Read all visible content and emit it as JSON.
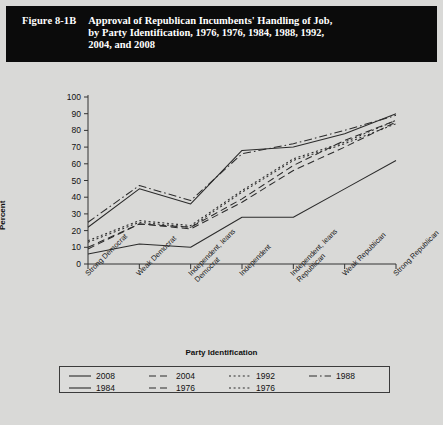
{
  "figure": {
    "number": "Figure 8-1B",
    "title_lines": [
      "Approval of Republican Incumbents' Handling of Job,",
      "by Party Identification, 1976, 1976, 1984, 1988, 1992,",
      "2004, and 2008"
    ]
  },
  "chart_data": {
    "type": "line",
    "title": "Approval of Republican Incumbents' Handling of Job, by Party Identification, 1976, 1976, 1984, 1988, 1992, 2004, and 2008",
    "xlabel": "Party Identification",
    "ylabel": "Percent",
    "ylim": [
      0,
      100
    ],
    "yticks": [
      0,
      10,
      20,
      30,
      40,
      50,
      60,
      70,
      80,
      90,
      100
    ],
    "grid": false,
    "legend_position": "bottom",
    "categories": [
      "Strong Democrat",
      "Weak Democrat",
      "Independent, leans Democrat",
      "Independent",
      "Independent, leans Republican",
      "Weak Republican",
      "Strong Republican"
    ],
    "category_lines": [
      [
        "Strong Democrat",
        ""
      ],
      [
        "Weak Democrat",
        ""
      ],
      [
        "Independent, leans",
        "Democrat"
      ],
      [
        "Independent",
        ""
      ],
      [
        "Independent, leans",
        "Republican"
      ],
      [
        "Weak Republican",
        ""
      ],
      [
        "Strong Republican",
        ""
      ]
    ],
    "series": [
      {
        "name": "2008",
        "dash": "solid",
        "values": [
          6,
          12,
          10,
          28,
          28,
          45,
          62
        ]
      },
      {
        "name": "2004",
        "dash": "dashed",
        "values": [
          9,
          24,
          22,
          39,
          59,
          74,
          86
        ]
      },
      {
        "name": "1992",
        "dash": "dotted",
        "values": [
          13,
          25,
          22,
          43,
          62,
          72,
          84
        ]
      },
      {
        "name": "1988",
        "dash": "dashdot",
        "values": [
          25,
          47,
          38,
          66,
          72,
          80,
          89
        ]
      },
      {
        "name": "1984",
        "dash": "solid",
        "values": [
          22,
          45,
          36,
          68,
          70,
          78,
          90
        ]
      },
      {
        "name": "1976",
        "dash": "dashed",
        "values": [
          10,
          24,
          21,
          37,
          56,
          70,
          85
        ]
      },
      {
        "name": "1976",
        "dash": "dotted",
        "values": [
          14,
          26,
          23,
          44,
          63,
          73,
          86
        ]
      }
    ]
  },
  "legend": {
    "rows": [
      [
        {
          "label": "2008",
          "dash": "solid"
        },
        {
          "label": "2004",
          "dash": "dashed"
        },
        {
          "label": "1992",
          "dash": "dotted"
        },
        {
          "label": "1988",
          "dash": "dashdot"
        }
      ],
      [
        {
          "label": "1984",
          "dash": "solid"
        },
        {
          "label": "1976",
          "dash": "dashed"
        },
        {
          "label": "1976",
          "dash": "dotted"
        }
      ]
    ]
  },
  "colors": {
    "banner_bg": "#0b0b0b",
    "banner_text": "#ffffff",
    "page_bg": "#d9d9d7",
    "line": "#2b2b2b",
    "axis": "#333333"
  }
}
